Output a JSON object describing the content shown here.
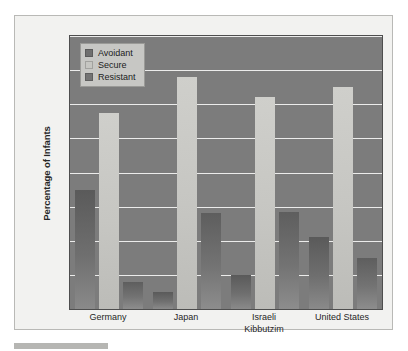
{
  "chart_data": {
    "type": "bar",
    "title": "",
    "subtitle": "",
    "xlabel": "",
    "ylabel": "Percentage of Infants",
    "ylim": [
      0,
      80
    ],
    "yticks": [
      0,
      10,
      20,
      30,
      40,
      50,
      60,
      70,
      80
    ],
    "ytick_labels": [
      "0",
      "10",
      "20",
      "30",
      "40",
      "50",
      "60",
      "70",
      "80"
    ],
    "grid": true,
    "legend_position": "top-left",
    "categories": [
      "Germany",
      "Japan",
      "Israeli Kibbutzim",
      "United States"
    ],
    "category_lines": [
      [
        "Germany"
      ],
      [
        "Japan"
      ],
      [
        "Israeli",
        "Kibbutzim"
      ],
      [
        "United States"
      ]
    ],
    "series": [
      {
        "name": "Avoidant",
        "color": "#6f6f6f",
        "values": [
          35,
          5,
          10,
          21
        ]
      },
      {
        "name": "Secure",
        "color": "#c6c6c2",
        "values": [
          57.5,
          68,
          62,
          65
        ]
      },
      {
        "name": "Resistant",
        "color": "#737373",
        "values": [
          8,
          28,
          28.5,
          15
        ]
      }
    ],
    "plot_background": "#7c7c7c",
    "gridline_color": "#ececeb",
    "card_background": "#f2f2f0",
    "axis_text_color": "#262626"
  },
  "legend": {
    "items": [
      {
        "label": "Avoidant",
        "color": "#6f6f6f"
      },
      {
        "label": "Secure",
        "color": "#c6c6c2"
      },
      {
        "label": "Resistant",
        "color": "#737373"
      }
    ]
  }
}
